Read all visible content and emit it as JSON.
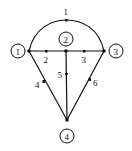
{
  "diagram": {
    "type": "directed-graph",
    "colors": {
      "stroke": "#111111",
      "background": "#ffffff"
    },
    "nodes": [
      {
        "id": "1",
        "label": "1",
        "cx": 18,
        "cy": 51,
        "jx": 29,
        "jy": 51
      },
      {
        "id": "2",
        "label": "2",
        "cx": 66,
        "cy": 39,
        "jx": 66,
        "jy": 51
      },
      {
        "id": "3",
        "label": "3",
        "cx": 116,
        "cy": 51,
        "jx": 104,
        "jy": 51
      },
      {
        "id": "4",
        "label": "4",
        "cx": 67,
        "cy": 136,
        "jx": 67,
        "jy": 120
      }
    ],
    "edges": [
      {
        "id": "1",
        "label": "1",
        "from": "1",
        "to": "3",
        "shape": "arc"
      },
      {
        "id": "2",
        "label": "2",
        "from": "1",
        "to": "2"
      },
      {
        "id": "3",
        "label": "3",
        "from": "2",
        "to": "3"
      },
      {
        "id": "4",
        "label": "4",
        "from": "1",
        "to": "4"
      },
      {
        "id": "5",
        "label": "5",
        "from": "2",
        "to": "4"
      },
      {
        "id": "6",
        "label": "6",
        "from": "4",
        "to": "3"
      }
    ]
  }
}
